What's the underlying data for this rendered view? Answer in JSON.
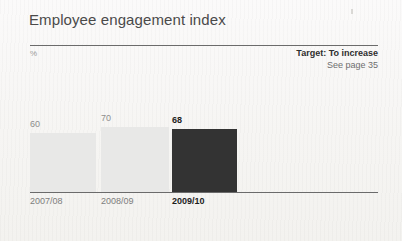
{
  "figure": {
    "title": "Employee engagement index",
    "unit_label": "%",
    "target_label": "Target: To increase",
    "page_reference": "See page 35"
  },
  "colors": {
    "page_background": "#f7f6f4",
    "title_text": "#4a4a4a",
    "rule": "#6b6b6b",
    "bar_light": "#e8e8e7",
    "bar_dark": "#333333",
    "muted_text": "#8d8d8d",
    "emphasis_text": "#1d1d1d"
  },
  "chart_data": {
    "type": "bar",
    "title": "Employee engagement index",
    "xlabel": "",
    "ylabel": "%",
    "ylim": [
      0,
      100
    ],
    "grid": false,
    "legend": false,
    "categories": [
      "2007/08",
      "2008/09",
      "2009/10"
    ],
    "values": [
      60,
      70,
      68
    ],
    "value_labels": [
      "60",
      "70",
      "68"
    ],
    "highlight_index": 2,
    "annotations": [
      "Target: To increase",
      "See page 35"
    ],
    "bars": [
      {
        "category": "2007/08",
        "value": 60,
        "label": "68_not_used",
        "value_label": "60",
        "color": "#e8e8e7",
        "emphasis": false,
        "left": 30,
        "width": 66,
        "top": 133
      },
      {
        "category": "2008/09",
        "value": 70,
        "value_label": "70",
        "color": "#e8e8e7",
        "emphasis": false,
        "left": 101,
        "width": 68,
        "top": 127
      },
      {
        "category": "2009/10",
        "value": 68,
        "value_label": "68",
        "color": "#333333",
        "emphasis": true,
        "left": 172,
        "width": 65,
        "top": 129
      }
    ]
  }
}
